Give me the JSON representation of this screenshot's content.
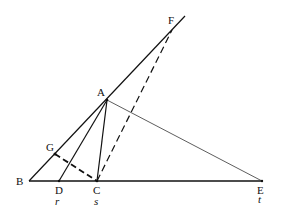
{
  "diagram": {
    "type": "geometry-construction",
    "background": "#ffffff",
    "stroke_color": "#111111",
    "points": {
      "A": {
        "label": "A",
        "x": 107,
        "y": 100
      },
      "B": {
        "label": "B",
        "x": 29,
        "y": 181
      },
      "C": {
        "label": "C",
        "x": 97,
        "y": 181
      },
      "D": {
        "label": "D",
        "x": 59,
        "y": 181
      },
      "E": {
        "label": "E",
        "x": 262,
        "y": 181
      },
      "F": {
        "label": "F",
        "x": 172,
        "y": 30
      },
      "G": {
        "label": "G",
        "x": 55,
        "y": 154
      }
    },
    "axis_labels": {
      "r": "r",
      "s": "s",
      "t": "t"
    },
    "segments": [
      {
        "name": "B-E",
        "from": "B",
        "to": "E",
        "style": "solid-thick"
      },
      {
        "name": "B-F-extended",
        "from": "B",
        "to": "F",
        "style": "solid",
        "extends_beyond": true
      },
      {
        "name": "A-D",
        "from": "A",
        "to": "D",
        "style": "solid"
      },
      {
        "name": "A-C",
        "from": "A",
        "to": "C",
        "style": "solid"
      },
      {
        "name": "A-E",
        "from": "A",
        "to": "E",
        "style": "solid-thin"
      },
      {
        "name": "C-F",
        "from": "C",
        "to": "F",
        "style": "dashed"
      },
      {
        "name": "G-C",
        "from": "G",
        "to": "C",
        "style": "dashed-thick"
      }
    ]
  }
}
